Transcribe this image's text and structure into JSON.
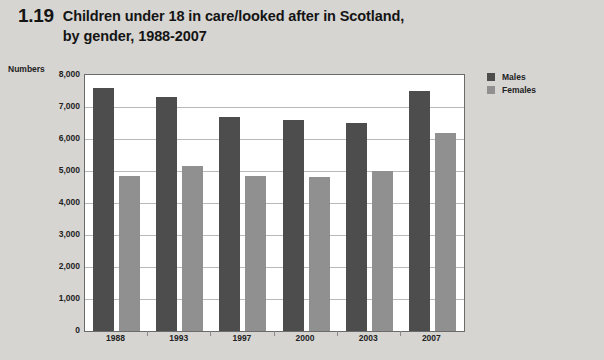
{
  "figure": {
    "number": "1.19",
    "title_lines": [
      "Children under 18 in care/looked after in Scotland,",
      "by gender, 1988-2007"
    ]
  },
  "legend": {
    "position": "top-right",
    "items": [
      {
        "label": "Males",
        "color": "#4d4d4d",
        "swatch": "legend-swatch-males"
      },
      {
        "label": "Females",
        "color": "#909090",
        "swatch": "legend-swatch-females"
      }
    ]
  },
  "chart_data": {
    "type": "bar",
    "title": "Children under 18 in care/looked after in Scotland, by gender, 1988-2007",
    "xlabel": "",
    "ylabel": "Numbers",
    "categories": [
      "1988",
      "1993",
      "1997",
      "2000",
      "2003",
      "2007"
    ],
    "series": [
      {
        "name": "Males",
        "color": "#4d4d4d",
        "values": [
          7600,
          7300,
          6700,
          6600,
          6500,
          7500
        ]
      },
      {
        "name": "Females",
        "color": "#909090",
        "values": [
          4850,
          5150,
          4850,
          4800,
          5000,
          6200
        ]
      }
    ],
    "ylim": [
      0,
      8000
    ],
    "ytick_step": 1000,
    "ytick_labels": [
      "8,000",
      "7,000",
      "6,000",
      "5,000",
      "4,000",
      "3,000",
      "2,000",
      "1,000",
      "0"
    ],
    "ytick_values": [
      8000,
      7000,
      6000,
      5000,
      4000,
      3000,
      2000,
      1000,
      0
    ],
    "grid": true,
    "grid_axis": "y",
    "plot_background": "#ffffff",
    "figure_background": "#d6d5d2"
  }
}
